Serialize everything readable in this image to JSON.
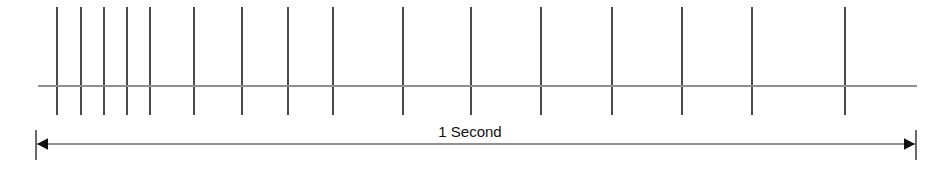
{
  "figure": {
    "width": 941,
    "height": 181,
    "background_color": "#ffffff"
  },
  "dimension": {
    "label": "1 Second",
    "label_x": 470,
    "label_y": 137,
    "line_y": 144,
    "x_start": 36,
    "x_end": 916,
    "cap_top": 130,
    "cap_bottom": 160,
    "arrow_size": 11,
    "color": "#6b6b6b",
    "arrow_color": "#111111"
  },
  "axis": {
    "baseline_y": 86,
    "x_start": 38,
    "x_end": 917,
    "color": "#8f8f8f"
  },
  "ticks": {
    "color": "#4a4a4a",
    "y_top": 7,
    "y_bottom": 115,
    "count": 16,
    "x_positions": [
      57,
      81,
      104,
      127,
      150,
      194,
      242,
      288,
      333,
      403,
      471,
      541,
      612,
      682,
      752,
      845
    ]
  },
  "chart_data": {
    "type": "scatter",
    "title": "1 Second",
    "xlabel": "Time (1 Second span)",
    "ylabel": "",
    "xlim": [
      0,
      1
    ],
    "grid": false,
    "legend": null,
    "categories": [
      "p1",
      "p2",
      "p3",
      "p4",
      "p5",
      "p6",
      "p7",
      "p8",
      "p9",
      "p10",
      "p11",
      "p12",
      "p13",
      "p14",
      "p15",
      "p16"
    ],
    "series": [
      {
        "name": "pulse event times (fraction of 1 second)",
        "x": [
          0.024,
          0.051,
          0.077,
          0.103,
          0.13,
          0.177,
          0.232,
          0.284,
          0.335,
          0.415,
          0.492,
          0.572,
          0.653,
          0.732,
          0.812,
          0.918
        ],
        "values": [
          1,
          1,
          1,
          1,
          1,
          1,
          1,
          1,
          1,
          1,
          1,
          1,
          1,
          1,
          1,
          1
        ]
      },
      {
        "name": "pulse x pixel positions",
        "x": [
          57,
          81,
          104,
          127,
          150,
          194,
          242,
          288,
          333,
          403,
          471,
          541,
          612,
          682,
          752,
          845
        ],
        "values": [
          1,
          1,
          1,
          1,
          1,
          1,
          1,
          1,
          1,
          1,
          1,
          1,
          1,
          1,
          1,
          1
        ]
      }
    ],
    "annotations": [
      {
        "text": "1 Second",
        "x": 0.49,
        "y": 0,
        "type": "dimension-span",
        "span_start": 0.0,
        "span_end": 1.0
      }
    ]
  }
}
